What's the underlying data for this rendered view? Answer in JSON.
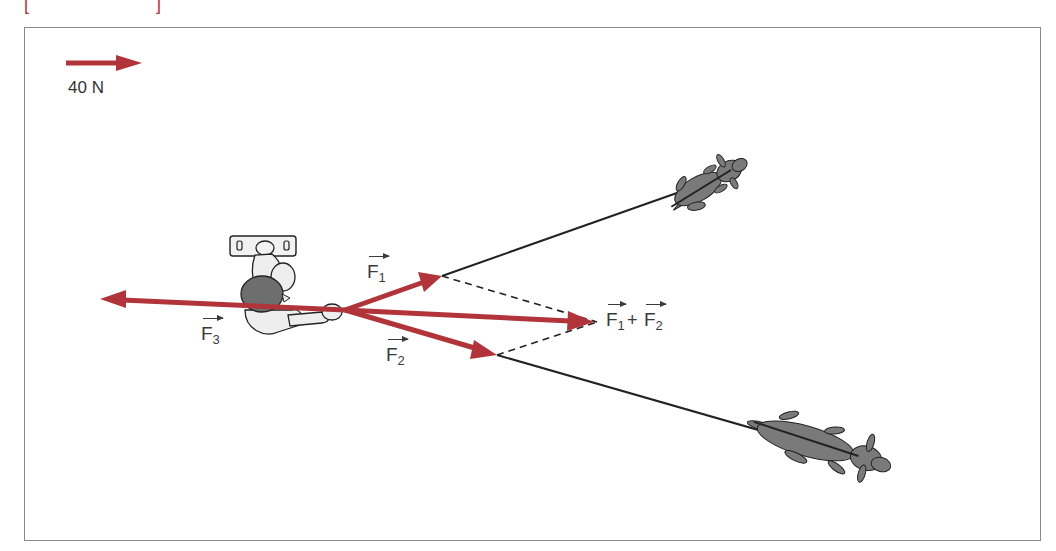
{
  "figure": {
    "scale": {
      "label": "40 N",
      "arrow_length_px": 76
    },
    "forces": {
      "F1": {
        "symbol": "F",
        "sub": "1"
      },
      "F2": {
        "symbol": "F",
        "sub": "2"
      },
      "F3": {
        "symbol": "F",
        "sub": "3"
      },
      "resultant": {
        "a_symbol": "F",
        "a_sub": "1",
        "plus": "+",
        "b_symbol": "F",
        "b_sub": "2"
      }
    },
    "colors": {
      "force_arrow": "#b0343a",
      "rope": "#222222",
      "frame": "#8a8a8a",
      "dog": "#7a7a7a",
      "person_hair": "#6e6e6e"
    },
    "top_bracket": {
      "left": "[",
      "right": "]"
    }
  }
}
